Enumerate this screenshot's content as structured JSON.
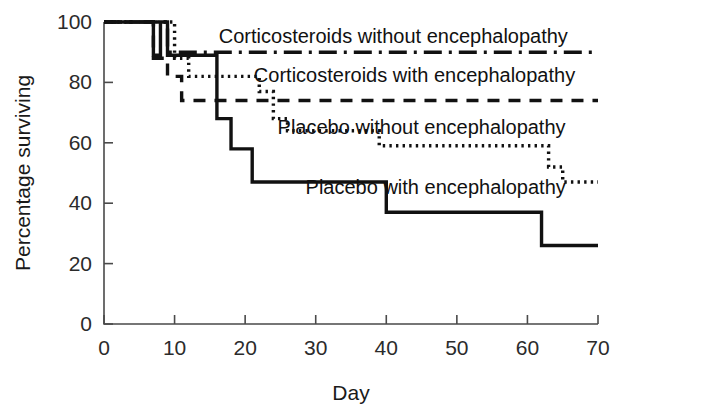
{
  "chart_data": {
    "type": "line",
    "title": "",
    "subtitle": "",
    "xlabel": "Day",
    "ylabel": "Percentage surviving",
    "xlim": [
      0,
      70
    ],
    "ylim": [
      0,
      100
    ],
    "xticks": [
      0,
      10,
      20,
      30,
      40,
      50,
      60,
      70
    ],
    "yticks": [
      0,
      20,
      40,
      60,
      80,
      100
    ],
    "grid": false,
    "legend_position": "inline-annotations",
    "plot_kind": "kaplan-meier-step",
    "series": [
      {
        "name": "Corticosteroids without encephalopathy",
        "style": "dash-dot",
        "label_x": 41,
        "label_y": 93,
        "points": [
          {
            "day": 0,
            "pct": 100
          },
          {
            "day": 9,
            "pct": 100
          },
          {
            "day": 9,
            "pct": 90
          },
          {
            "day": 70,
            "pct": 90
          }
        ]
      },
      {
        "name": "Corticosteroids with encephalopathy",
        "style": "dashed",
        "label_x": 44,
        "label_y": 80,
        "points": [
          {
            "day": 0,
            "pct": 100
          },
          {
            "day": 7,
            "pct": 100
          },
          {
            "day": 7,
            "pct": 88
          },
          {
            "day": 9,
            "pct": 88
          },
          {
            "day": 9,
            "pct": 82
          },
          {
            "day": 11,
            "pct": 82
          },
          {
            "day": 11,
            "pct": 74
          },
          {
            "day": 70,
            "pct": 74
          }
        ]
      },
      {
        "name": "Placebo without encephalopathy",
        "style": "dotted",
        "label_x": 45,
        "label_y": 63,
        "points": [
          {
            "day": 0,
            "pct": 100
          },
          {
            "day": 10,
            "pct": 100
          },
          {
            "day": 10,
            "pct": 88
          },
          {
            "day": 12,
            "pct": 88
          },
          {
            "day": 12,
            "pct": 82
          },
          {
            "day": 22,
            "pct": 82
          },
          {
            "day": 22,
            "pct": 77
          },
          {
            "day": 24,
            "pct": 77
          },
          {
            "day": 24,
            "pct": 68
          },
          {
            "day": 26,
            "pct": 68
          },
          {
            "day": 26,
            "pct": 64
          },
          {
            "day": 39,
            "pct": 64
          },
          {
            "day": 39,
            "pct": 59
          },
          {
            "day": 63,
            "pct": 59
          },
          {
            "day": 63,
            "pct": 52
          },
          {
            "day": 65,
            "pct": 52
          },
          {
            "day": 65,
            "pct": 47
          },
          {
            "day": 70,
            "pct": 47
          }
        ]
      },
      {
        "name": "Placebo with encephalopathy",
        "style": "solid",
        "label_x": 47,
        "label_y": 43,
        "points": [
          {
            "day": 0,
            "pct": 100
          },
          {
            "day": 7,
            "pct": 100
          },
          {
            "day": 7,
            "pct": 89
          },
          {
            "day": 8,
            "pct": 89
          },
          {
            "day": 8,
            "pct": 100
          },
          {
            "day": 9,
            "pct": 100
          },
          {
            "day": 9,
            "pct": 89
          },
          {
            "day": 16,
            "pct": 89
          },
          {
            "day": 16,
            "pct": 68
          },
          {
            "day": 18,
            "pct": 68
          },
          {
            "day": 18,
            "pct": 58
          },
          {
            "day": 21,
            "pct": 58
          },
          {
            "day": 21,
            "pct": 47
          },
          {
            "day": 40,
            "pct": 47
          },
          {
            "day": 40,
            "pct": 37
          },
          {
            "day": 62,
            "pct": 37
          },
          {
            "day": 62,
            "pct": 26
          },
          {
            "day": 70,
            "pct": 26
          }
        ]
      }
    ]
  },
  "axes": {
    "x": {
      "title": "Day",
      "tick_labels": [
        "0",
        "10",
        "20",
        "30",
        "40",
        "50",
        "60",
        "70"
      ]
    },
    "y": {
      "title": "Percentage surviving",
      "tick_labels": [
        "0",
        "20",
        "40",
        "60",
        "80",
        "100"
      ]
    }
  },
  "annotations": [
    {
      "text": "Corticosteroids without encephalopathy"
    },
    {
      "text": "Corticosteroids with encephalopathy"
    },
    {
      "text": "Placebo without encephalopathy"
    },
    {
      "text": "Placebo with encephalopathy"
    }
  ],
  "colors": {
    "ink": "#111111",
    "axis": "#4a4a4a",
    "background": "#ffffff"
  }
}
